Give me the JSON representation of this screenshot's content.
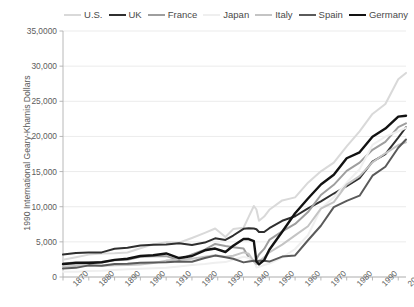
{
  "chart_data": {
    "type": "line",
    "title": "",
    "xlabel": "",
    "ylabel": "1990 International Geary-Khamis Dollars",
    "xlim": [
      1870,
      2003
    ],
    "ylim": [
      0,
      35000
    ],
    "grid": true,
    "legend_position": "top-right",
    "y_ticks": [
      {
        "value": 35000,
        "label": "35,0000"
      },
      {
        "value": 30000,
        "label": "30,000"
      },
      {
        "value": 25000,
        "label": "25,000"
      },
      {
        "value": 20000,
        "label": "20,000"
      },
      {
        "value": 15000,
        "label": "15,000"
      },
      {
        "value": 10000,
        "label": "10,000"
      },
      {
        "value": 5000,
        "label": "5,000"
      },
      {
        "value": 0,
        "label": "0"
      }
    ],
    "x_ticks": [
      {
        "value": 1870,
        "label": "1870"
      },
      {
        "value": 1880,
        "label": "1880"
      },
      {
        "value": 1890,
        "label": "1890"
      },
      {
        "value": 1900,
        "label": "1900"
      },
      {
        "value": 1910,
        "label": "1910"
      },
      {
        "value": 1920,
        "label": "1920"
      },
      {
        "value": 1930,
        "label": "1930"
      },
      {
        "value": 1940,
        "label": "1940"
      },
      {
        "value": 1950,
        "label": "1950"
      },
      {
        "value": 1960,
        "label": "1960"
      },
      {
        "value": 1970,
        "label": "1970"
      },
      {
        "value": 1980,
        "label": "1980"
      },
      {
        "value": 1990,
        "label": "1990"
      },
      {
        "value": 2000,
        "label": "2000"
      }
    ],
    "series": [
      {
        "name": "U.S.",
        "color": "#d9d9d9",
        "width": 2.0,
        "x": [
          1870,
          1875,
          1880,
          1885,
          1890,
          1895,
          1900,
          1905,
          1910,
          1915,
          1920,
          1925,
          1929,
          1933,
          1936,
          1940,
          1942,
          1944,
          1945,
          1946,
          1948,
          1950,
          1955,
          1960,
          1965,
          1970,
          1975,
          1980,
          1985,
          1990,
          1995,
          2000,
          2003
        ],
        "values": [
          2445,
          2800,
          3184,
          3350,
          3392,
          3480,
          4091,
          4642,
          4964,
          4864,
          5552,
          6282,
          6899,
          5695,
          6818,
          7010,
          8560,
          10100,
          9600,
          8000,
          8600,
          9561,
          10897,
          11328,
          13419,
          15030,
          16284,
          18577,
          20717,
          23201,
          24608,
          28129,
          29037
        ]
      },
      {
        "name": "UK",
        "color": "#2f2f2f",
        "width": 2.0,
        "x": [
          1870,
          1875,
          1880,
          1885,
          1890,
          1895,
          1900,
          1905,
          1910,
          1915,
          1920,
          1925,
          1929,
          1933,
          1936,
          1940,
          1942,
          1944,
          1945,
          1946,
          1948,
          1950,
          1955,
          1960,
          1965,
          1970,
          1975,
          1980,
          1985,
          1990,
          1995,
          2000,
          2003
        ],
        "values": [
          3190,
          3430,
          3477,
          3500,
          4009,
          4170,
          4492,
          4600,
          4611,
          4800,
          4548,
          4900,
          5503,
          5277,
          5900,
          6856,
          6950,
          6900,
          6800,
          6400,
          6400,
          6939,
          8000,
          8645,
          9752,
          10767,
          11878,
          12931,
          14071,
          16430,
          17491,
          19817,
          21310
        ]
      },
      {
        "name": "France",
        "color": "#9e9e9e",
        "width": 2.0,
        "x": [
          1870,
          1875,
          1880,
          1885,
          1890,
          1895,
          1900,
          1905,
          1910,
          1915,
          1920,
          1925,
          1929,
          1933,
          1936,
          1940,
          1942,
          1944,
          1945,
          1946,
          1948,
          1950,
          1955,
          1960,
          1965,
          1970,
          1975,
          1980,
          1985,
          1990,
          1995,
          2000,
          2003
        ],
        "values": [
          1876,
          2100,
          2120,
          2100,
          2376,
          2450,
          2876,
          2950,
          2965,
          2400,
          3227,
          3900,
          4710,
          4400,
          4244,
          4042,
          2800,
          2200,
          2573,
          3200,
          4000,
          5271,
          6500,
          7546,
          9243,
          11664,
          13114,
          15106,
          16268,
          18093,
          19236,
          21311,
          21861
        ]
      },
      {
        "name": "Japan",
        "color": "#efefef",
        "width": 2.0,
        "x": [
          1870,
          1875,
          1880,
          1885,
          1890,
          1895,
          1900,
          1905,
          1910,
          1915,
          1920,
          1925,
          1929,
          1933,
          1936,
          1940,
          1942,
          1944,
          1945,
          1946,
          1948,
          1950,
          1955,
          1960,
          1965,
          1970,
          1975,
          1980,
          1985,
          1990,
          1995,
          2000,
          2003
        ],
        "values": [
          737,
          760,
          860,
          890,
          1012,
          1100,
          1180,
          1230,
          1304,
          1500,
          1696,
          1850,
          2026,
          2122,
          2444,
          2874,
          2700,
          2400,
          1346,
          1444,
          1700,
          1921,
          2771,
          3986,
          5934,
          9714,
          11344,
          13428,
          15331,
          18789,
          19979,
          20738,
          21218
        ]
      },
      {
        "name": "Italy",
        "color": "#c4c4c4",
        "width": 2.0,
        "x": [
          1870,
          1875,
          1880,
          1885,
          1890,
          1895,
          1900,
          1905,
          1910,
          1915,
          1920,
          1925,
          1929,
          1933,
          1936,
          1940,
          1942,
          1944,
          1945,
          1946,
          1948,
          1950,
          1955,
          1960,
          1965,
          1970,
          1975,
          1980,
          1985,
          1990,
          1995,
          2000,
          2003
        ],
        "values": [
          1499,
          1580,
          1581,
          1600,
          1667,
          1700,
          1785,
          2000,
          2332,
          2500,
          2587,
          2900,
          3093,
          2900,
          3031,
          3505,
          3300,
          2200,
          1824,
          2200,
          2800,
          3502,
          4600,
          5916,
          7216,
          9719,
          10643,
          13149,
          14354,
          16313,
          17600,
          18774,
          19150
        ]
      },
      {
        "name": "Spain",
        "color": "#5a5a5a",
        "width": 2.0,
        "x": [
          1870,
          1875,
          1880,
          1885,
          1890,
          1895,
          1900,
          1905,
          1910,
          1915,
          1920,
          1925,
          1929,
          1933,
          1936,
          1940,
          1942,
          1944,
          1945,
          1946,
          1948,
          1950,
          1955,
          1960,
          1965,
          1970,
          1975,
          1980,
          1985,
          1990,
          1995,
          2000,
          2003
        ],
        "values": [
          1207,
          1300,
          1654,
          1600,
          1847,
          1900,
          2040,
          2050,
          2096,
          2200,
          2177,
          2700,
          3043,
          2800,
          2600,
          2080,
          2200,
          2300,
          2189,
          2300,
          2300,
          2189,
          2900,
          3072,
          5226,
          7291,
          9944,
          10840,
          11569,
          14417,
          15685,
          18396,
          19568
        ]
      },
      {
        "name": "Germany",
        "color": "#121212",
        "width": 2.4,
        "x": [
          1870,
          1875,
          1880,
          1885,
          1890,
          1895,
          1900,
          1905,
          1910,
          1915,
          1920,
          1925,
          1929,
          1933,
          1936,
          1940,
          1942,
          1944,
          1945,
          1946,
          1948,
          1950,
          1955,
          1960,
          1965,
          1970,
          1975,
          1980,
          1985,
          1990,
          1995,
          2000,
          2003
        ],
        "values": [
          1839,
          2000,
          1991,
          2100,
          2428,
          2600,
          2985,
          3100,
          3348,
          2700,
          2986,
          3800,
          4051,
          3556,
          4451,
          5403,
          5400,
          5100,
          2200,
          1800,
          2400,
          3881,
          6430,
          9070,
          11173,
          13154,
          14542,
          16893,
          17744,
          19955,
          21121,
          22810,
          22941
        ]
      }
    ]
  },
  "legend": {
    "items": [
      {
        "label": "U.S."
      },
      {
        "label": "UK"
      },
      {
        "label": "France"
      },
      {
        "label": "Japan"
      },
      {
        "label": "Italy"
      },
      {
        "label": "Spain"
      },
      {
        "label": "Germany"
      }
    ]
  }
}
